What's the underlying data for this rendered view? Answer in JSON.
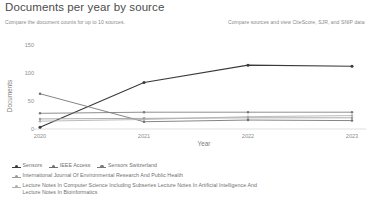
{
  "header": {
    "title": "Documents per year by source",
    "subtitle": "Compare the document counts for up to 10 sources.",
    "right_link": "Compare sources and view CiteScore, SJR, and SNIP data"
  },
  "chart_data": {
    "type": "line",
    "title": "",
    "xlabel": "Year",
    "ylabel": "Documents",
    "categories": [
      "2020",
      "2021",
      "2022",
      "2023"
    ],
    "x": [
      2020,
      2021,
      2022,
      2023
    ],
    "ylim": [
      0,
      150
    ],
    "yticks": [
      0,
      50,
      100,
      150
    ],
    "grid": false,
    "legend_position": "bottom",
    "markers": "circle",
    "series": [
      {
        "name": "Sensors",
        "color": "#3a3a3a",
        "values": [
          3,
          83,
          114,
          112
        ]
      },
      {
        "name": "IEEE Access",
        "color": "#6f6f6f",
        "values": [
          63,
          13,
          16,
          15
        ]
      },
      {
        "name": "Sensors Switzerland",
        "color": "#7a7a7a",
        "values": [
          28,
          30,
          30,
          30
        ]
      },
      {
        "name": "International Journal Of Environmental Research And Public Health",
        "color": "#9c9c9c",
        "values": [
          18,
          19,
          20,
          20
        ]
      },
      {
        "name": "Lecture Notes In Computer Science Including Subseries Lecture Notes In Artificial Intelligence And Lecture Notes In Bioinformatics",
        "color": "#b0b0b0",
        "values": [
          14,
          17,
          22,
          24
        ]
      }
    ]
  },
  "colors": {
    "axis": "#c9c9c9",
    "tick_text": "#8e8e8e",
    "title": "#4c4c4c",
    "muted": "#8a8a8a"
  }
}
